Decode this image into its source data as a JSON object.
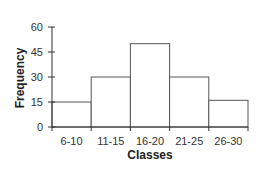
{
  "chart_data": {
    "type": "bar",
    "title": "",
    "xlabel": "Classes",
    "ylabel": "Frequency",
    "categories": [
      "6-10",
      "11-15",
      "16-20",
      "21-25",
      "26-30"
    ],
    "values": [
      15,
      30,
      50,
      30,
      16
    ],
    "ylim": [
      0,
      60
    ],
    "yticks": [
      "0",
      "15",
      "30",
      "45",
      "60"
    ],
    "grid": false,
    "legend": null,
    "bar_fill": "#ffffff",
    "bar_stroke": "#555555"
  }
}
